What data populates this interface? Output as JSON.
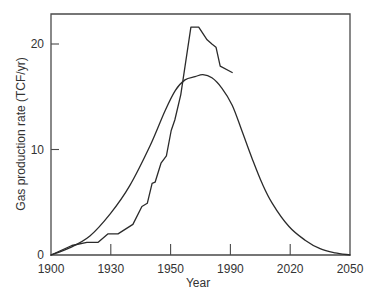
{
  "chart_data": {
    "type": "line",
    "title": "",
    "xlabel": "Year",
    "ylabel": "Gas production rate (TCF/yr)",
    "x_tick_labels": [
      "1900",
      "1930",
      "1950",
      "1990",
      "2020",
      "2050"
    ],
    "y_tick_labels": [
      "0",
      "10",
      "20"
    ],
    "xlim": [
      1900,
      2050
    ],
    "ylim": [
      0,
      22.7
    ],
    "grid": false,
    "legend": null,
    "note": "x-axis tick labels are evenly spaced on the plot despite non-uniform year intervals; x positions below are expressed as fractional tick index (0 = 1900 tick, 5 = 2050 tick).",
    "series": [
      {
        "name": "Historical production",
        "style": "jagged",
        "points": [
          {
            "t": 0.0,
            "y": 0.0
          },
          {
            "t": 0.35,
            "y": 0.9
          },
          {
            "t": 0.6,
            "y": 1.2
          },
          {
            "t": 0.79,
            "y": 1.2
          },
          {
            "t": 0.95,
            "y": 2.0
          },
          {
            "t": 1.12,
            "y": 2.0
          },
          {
            "t": 1.37,
            "y": 2.9
          },
          {
            "t": 1.52,
            "y": 4.6
          },
          {
            "t": 1.61,
            "y": 4.9
          },
          {
            "t": 1.69,
            "y": 6.8
          },
          {
            "t": 1.74,
            "y": 6.9
          },
          {
            "t": 1.84,
            "y": 8.7
          },
          {
            "t": 1.93,
            "y": 9.4
          },
          {
            "t": 2.01,
            "y": 11.8
          },
          {
            "t": 2.07,
            "y": 12.8
          },
          {
            "t": 2.17,
            "y": 15.2
          },
          {
            "t": 2.34,
            "y": 21.6
          },
          {
            "t": 2.47,
            "y": 21.6
          },
          {
            "t": 2.61,
            "y": 20.4
          },
          {
            "t": 2.69,
            "y": 20.0
          },
          {
            "t": 2.76,
            "y": 19.7
          },
          {
            "t": 2.83,
            "y": 17.9
          },
          {
            "t": 3.03,
            "y": 17.3
          }
        ]
      },
      {
        "name": "Hubbert curve fit",
        "style": "smooth",
        "points": [
          {
            "t": 0.0,
            "y": 0.0
          },
          {
            "t": 0.32,
            "y": 0.7
          },
          {
            "t": 0.65,
            "y": 1.8
          },
          {
            "t": 0.99,
            "y": 3.9
          },
          {
            "t": 1.32,
            "y": 6.6
          },
          {
            "t": 1.66,
            "y": 10.4
          },
          {
            "t": 1.91,
            "y": 13.7
          },
          {
            "t": 2.08,
            "y": 15.6
          },
          {
            "t": 2.24,
            "y": 16.6
          },
          {
            "t": 2.41,
            "y": 16.9
          },
          {
            "t": 2.54,
            "y": 17.1
          },
          {
            "t": 2.69,
            "y": 16.8
          },
          {
            "t": 2.86,
            "y": 15.8
          },
          {
            "t": 3.03,
            "y": 14.2
          },
          {
            "t": 3.19,
            "y": 11.8
          },
          {
            "t": 3.36,
            "y": 9.2
          },
          {
            "t": 3.53,
            "y": 6.8
          },
          {
            "t": 3.7,
            "y": 4.9
          },
          {
            "t": 3.98,
            "y": 2.7
          },
          {
            "t": 4.25,
            "y": 1.4
          },
          {
            "t": 4.5,
            "y": 0.6
          },
          {
            "t": 4.75,
            "y": 0.2
          },
          {
            "t": 5.0,
            "y": 0.0
          }
        ]
      }
    ]
  },
  "layout": {
    "plot": {
      "left": 51,
      "right": 350,
      "top": 14,
      "bottom": 255
    },
    "y_scale_px_per_unit": 10.55,
    "x_px_per_tick": 59.8,
    "line_color": "#2b2b2b",
    "axis_color": "#4a4a4a"
  }
}
